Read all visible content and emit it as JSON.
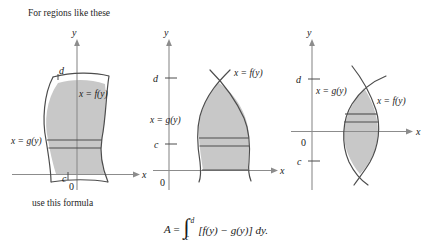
{
  "figure": {
    "caption_top": "For regions like these",
    "caption_bottom": "use this formula",
    "background_color": "#ffffff",
    "fill_color": "#c8c8c8",
    "stroke_color": "#4d4d4d",
    "axis_color": "#808080"
  },
  "formula": {
    "lhs": "A",
    "equals": "=",
    "integral_sign": "∫",
    "upper_limit": "d",
    "lower_limit": "c",
    "integrand": "[f(y) − g(y)] dy.",
    "full_text": "A = ∫ from c to d of [f(y) − g(y)] dy."
  },
  "panels": [
    {
      "id": "panel-1",
      "name": "region-straddling-y-axis",
      "axis_labels": {
        "x": "x",
        "y": "y",
        "origin": "0"
      },
      "tick_labels": {
        "upper": "d",
        "lower": "c"
      },
      "curve_labels": {
        "right": "x = f(y)",
        "left": "x = g(y)"
      },
      "description": "Shaded region crossing the y-axis, bounded left by x = g(y) and right by x = f(y), from y = c up to y = d."
    },
    {
      "id": "panel-2",
      "name": "region-right-of-y-axis",
      "axis_labels": {
        "x": "x",
        "y": "y",
        "origin": "0"
      },
      "tick_labels": {
        "upper": "d",
        "lower": "c"
      },
      "curve_labels": {
        "right": "x = f(y)",
        "left": "x = g(y)"
      },
      "description": "Shaded region entirely right of the y-axis and above the x-axis; the curves cross at the top at y = d."
    },
    {
      "id": "panel-3",
      "name": "lens-region-crossing-x-axis",
      "axis_labels": {
        "x": "x",
        "y": "y",
        "origin": "0"
      },
      "tick_labels": {
        "upper": "d",
        "lower": "c"
      },
      "curve_labels": {
        "right": "x = f(y)",
        "left": "x = g(y)"
      },
      "description": "Lens-shaped region between two crossing curves, spanning the x-axis from y = c below to y = d above."
    }
  ]
}
